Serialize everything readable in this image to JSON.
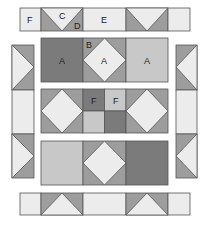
{
  "diagram": {
    "type": "quilt-block-layout",
    "colors": {
      "dark": "#7b7b7b",
      "medium": "#9d9d9d",
      "light": "#c8c8c8",
      "pale": "#ececec",
      "outline": "#555555"
    },
    "labels": {
      "top_f": "F",
      "top_c": "C",
      "top_d": "D",
      "top_e": "E",
      "center_b": "B",
      "row1_left_a": "A",
      "row1_mid_a": "A",
      "row1_right_a": "A",
      "row2_f_left": "F",
      "row2_f_right": "F"
    },
    "strips": {
      "top": [
        "F",
        "C/D flying-geese (down)",
        "E",
        "flying-geese (down)",
        "plain"
      ],
      "bottom": [
        "plain",
        "flying-geese (up)",
        "plain",
        "flying-geese (up)",
        "plain"
      ],
      "left": [
        "flying-geese (right)",
        "plain",
        "flying-geese (right)"
      ],
      "right": [
        "flying-geese (left)",
        "plain",
        "flying-geese (left)"
      ]
    },
    "center_rows": [
      [
        "dark square A",
        "square-in-square B/A",
        "light square A"
      ],
      [
        "square-in-square",
        "four-patch F/F",
        "square-in-square"
      ],
      [
        "light square",
        "square-in-square",
        "dark square"
      ]
    ]
  }
}
